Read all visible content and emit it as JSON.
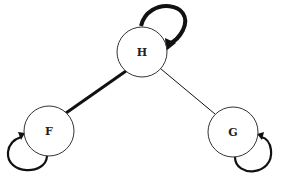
{
  "diagram": {
    "type": "directed-graph",
    "nodes": [
      {
        "id": "H",
        "label": "H",
        "cx": 142,
        "cy": 52,
        "r": 25
      },
      {
        "id": "F",
        "label": "F",
        "cx": 49,
        "cy": 131,
        "r": 25
      },
      {
        "id": "G",
        "label": "G",
        "cx": 233,
        "cy": 132,
        "r": 25
      }
    ],
    "edges": [
      {
        "from": "H",
        "to": "F",
        "weight": "thick"
      },
      {
        "from": "H",
        "to": "G",
        "weight": "thin"
      }
    ],
    "self_loops": [
      {
        "node": "H",
        "weight": "thick",
        "position": "top-right"
      },
      {
        "node": "F",
        "weight": "medium",
        "position": "bottom-left"
      },
      {
        "node": "G",
        "weight": "medium",
        "position": "bottom-right"
      }
    ],
    "colors": {
      "stroke": "#111111",
      "fill": "#ffffff"
    }
  }
}
